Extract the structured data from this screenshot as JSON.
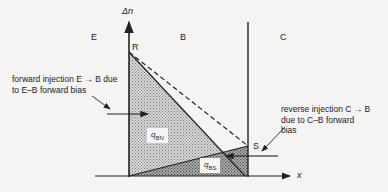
{
  "diagram": {
    "axes": {
      "y_label": "Δn",
      "x_label": "x"
    },
    "regions": [
      {
        "id": "emitter",
        "label": "E"
      },
      {
        "id": "base",
        "label": "B"
      },
      {
        "id": "collector",
        "label": "C"
      }
    ],
    "points": [
      {
        "id": "R",
        "label": "R"
      },
      {
        "id": "S",
        "label": "S"
      }
    ],
    "charges": [
      {
        "id": "qBN",
        "base": "q",
        "sub": "BN"
      },
      {
        "id": "qBS",
        "base": "q",
        "sub": "BS"
      }
    ],
    "annotations": {
      "forward": {
        "line1": "forward injection E → B due",
        "line2": "to E–B forward bias"
      },
      "reverse": {
        "line1": "reverse injection C → B",
        "line2": "due to C–B forward",
        "line3": "bias"
      }
    },
    "colors": {
      "ink": "#222222",
      "background": "#f4f4f2",
      "hatch_light": "#9a9a9a",
      "hatch_dark": "#666666"
    }
  }
}
